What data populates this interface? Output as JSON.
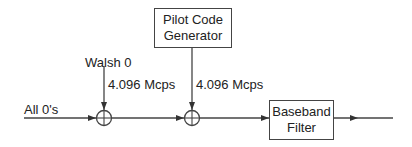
{
  "diagram": {
    "blocks": {
      "pilot": {
        "line1": "Pilot Code",
        "line2": "Generator"
      },
      "filter": {
        "line1": "Baseband",
        "line2": "Filter"
      }
    },
    "labels": {
      "input": "All 0's",
      "walsh": "Walsh 0",
      "rate1": "4.096 Mcps",
      "rate2": "4.096 Mcps"
    },
    "nodes": [
      "adder-1 (XOR)",
      "adder-2 (XOR)"
    ],
    "colors": {
      "line": "#444444",
      "text": "#222222"
    }
  }
}
